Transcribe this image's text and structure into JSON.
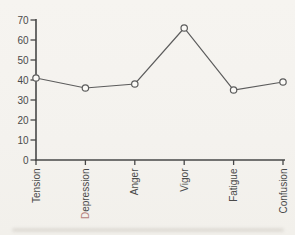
{
  "chart_data": {
    "type": "line",
    "categories": [
      "Tension",
      "Depression",
      "Anger",
      "Vigor",
      "Fatigue",
      "Confusion"
    ],
    "values": [
      41,
      36,
      38,
      66,
      35,
      39
    ],
    "yticks": [
      0,
      10,
      20,
      30,
      40,
      50,
      60,
      70
    ],
    "ylim": [
      0,
      70
    ],
    "title": "",
    "xlabel": "",
    "ylabel": "",
    "grid": false,
    "legend": false,
    "marker": "open-circle",
    "colors": {
      "background": "#f5f3ef",
      "line": "#5c5c5c",
      "marker_fill": "#fbfaf7",
      "axis": "#474747",
      "tick_label": "#4a4a4a"
    },
    "category_initial_colors": {
      "Depression": "#b5817d"
    }
  }
}
